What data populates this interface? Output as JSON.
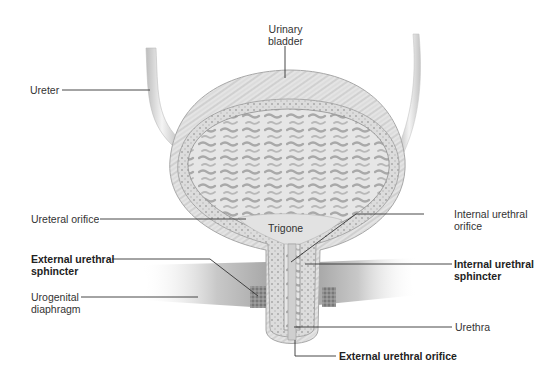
{
  "figure": {
    "colors": {
      "background": "#ffffff",
      "tissue": "#d8d8d8",
      "tissue_dark": "#9a9a9a",
      "leader_line": "#333333",
      "label_text": "#333333"
    },
    "labels": {
      "urinary_bladder": {
        "line1": "Urinary",
        "line2": "bladder",
        "bold": false
      },
      "ureter": {
        "line1": "Ureter",
        "bold": false
      },
      "ureteral_orifice": {
        "line1": "Ureteral orifice",
        "bold": false
      },
      "trigone": {
        "line1": "Trigone",
        "bold": false
      },
      "internal_urethral_orifice": {
        "line1": "Internal urethral",
        "line2": "orifice",
        "bold": false
      },
      "external_urethral_sphincter": {
        "line1": "External urethral",
        "line2": "sphincter",
        "bold": true
      },
      "internal_urethral_sphincter": {
        "line1": "Internal urethral",
        "line2": "sphincter",
        "bold": true
      },
      "urogenital_diaphragm": {
        "line1": "Urogenital",
        "line2": "diaphragm",
        "bold": false
      },
      "urethra": {
        "line1": "Urethra",
        "bold": false
      },
      "external_urethral_orifice": {
        "line1": "External urethral orifice",
        "bold": true
      }
    }
  }
}
